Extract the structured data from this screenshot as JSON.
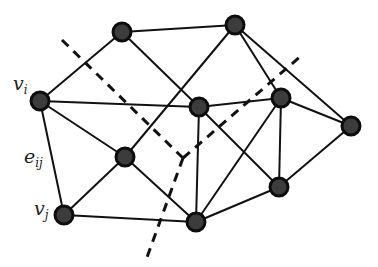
{
  "diagram": {
    "type": "graph-cut",
    "colors": {
      "node_fill": "#3c3c3c",
      "node_stroke": "#0d0d0d",
      "edge": "#111111",
      "cut_line": "#111111",
      "background": "#ffffff"
    },
    "labels": {
      "vi": {
        "base": "v",
        "sub": "i"
      },
      "vj": {
        "base": "v",
        "sub": "j"
      },
      "eij": {
        "base": "e",
        "sub": "ij"
      }
    },
    "nodes": [
      {
        "id": "n1",
        "x": 122,
        "y": 32
      },
      {
        "id": "n2",
        "x": 235,
        "y": 25
      },
      {
        "id": "vi",
        "x": 40,
        "y": 101
      },
      {
        "id": "n4",
        "x": 199,
        "y": 107
      },
      {
        "id": "n5",
        "x": 281,
        "y": 98
      },
      {
        "id": "n6",
        "x": 351,
        "y": 126
      },
      {
        "id": "n7",
        "x": 125,
        "y": 157
      },
      {
        "id": "n8",
        "x": 279,
        "y": 187
      },
      {
        "id": "vj",
        "x": 64,
        "y": 215
      },
      {
        "id": "n10",
        "x": 196,
        "y": 222
      }
    ],
    "edges": [
      [
        "n1",
        "n2"
      ],
      [
        "n1",
        "vi"
      ],
      [
        "n1",
        "n4"
      ],
      [
        "n2",
        "n7"
      ],
      [
        "n2",
        "n5"
      ],
      [
        "n2",
        "n6"
      ],
      [
        "vi",
        "n4"
      ],
      [
        "vi",
        "n7"
      ],
      [
        "vi",
        "vj"
      ],
      [
        "n4",
        "n5"
      ],
      [
        "n4",
        "n8"
      ],
      [
        "n4",
        "n10"
      ],
      [
        "n5",
        "n10"
      ],
      [
        "n5",
        "n8"
      ],
      [
        "n5",
        "n6"
      ],
      [
        "n6",
        "n8"
      ],
      [
        "n7",
        "vj"
      ],
      [
        "n7",
        "n10"
      ],
      [
        "vj",
        "n10"
      ],
      [
        "n8",
        "n10"
      ]
    ],
    "cut_lines": [
      {
        "from": [
          62,
          40
        ],
        "to": [
          183,
          158
        ]
      },
      {
        "from": [
          183,
          158
        ],
        "to": [
          302,
          55
        ]
      },
      {
        "from": [
          183,
          158
        ],
        "to": [
          146,
          260
        ]
      }
    ]
  }
}
